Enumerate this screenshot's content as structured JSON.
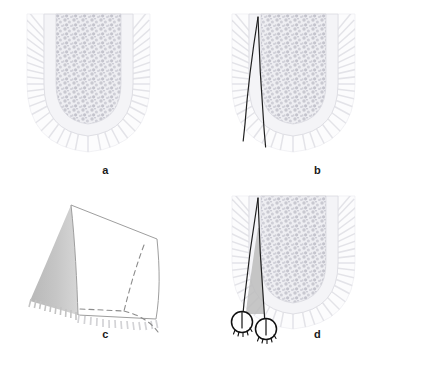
{
  "figure": {
    "background_color": "#ffffff",
    "width": 423,
    "height": 366,
    "panel_count": 4
  },
  "panels": [
    {
      "id": "a",
      "label": "a",
      "caption": "Cross-section of alveolar bone: cortical plate, trabecular bone and overlying soft tissue",
      "elements": [
        "soft-tissue-outline",
        "periosteum-hatching",
        "cortical-bone-layer",
        "trabecular-bone-texture"
      ]
    },
    {
      "id": "b",
      "label": "b",
      "caption": "Two vertical releasing incision lines converging at the crest",
      "elements": [
        "soft-tissue-outline",
        "periosteum-hatching",
        "cortical-bone-layer",
        "trabecular-bone-texture",
        "incision-line-anterior",
        "incision-line-posterior"
      ]
    },
    {
      "id": "c",
      "label": "c",
      "caption": "Three-dimensional view of the elevated pedicle flap wedge",
      "elements": [
        "flap-top-face",
        "flap-shaded-side-face",
        "flap-hidden-edges-dashed",
        "flap-serrated-base"
      ]
    },
    {
      "id": "d",
      "label": "d",
      "caption": "Repositioned flap secured with two interrupted sutures",
      "elements": [
        "soft-tissue-outline",
        "periosteum-hatching",
        "cortical-bone-layer",
        "trabecular-bone-texture",
        "incision-line-anterior",
        "incision-line-posterior",
        "flap-shaded-region",
        "suture-knot-left",
        "suture-knot-right"
      ]
    }
  ],
  "colors": {
    "background": "#ffffff",
    "soft_tissue_fill": "#fbfbfc",
    "soft_tissue_stroke": "#ececef",
    "periosteum_hatch": "#e6e6ea",
    "cortical_fill": "#f4f4f6",
    "cortical_stroke": "#d8d8de",
    "trabecular_fill": "#e9e9ee",
    "trabecular_speck": "#c6c6cd",
    "incision_line": "#1f1f1f",
    "flap_shade": "#bdbdbd",
    "flap_shade_light": "#c9c9c9",
    "flap_outline": "#9a9a9a",
    "dashed_line": "#8d8d8d",
    "suture_stroke": "#111111",
    "label_text": "#1a1a1a"
  },
  "labels": {
    "a": "a",
    "b": "b",
    "c": "c",
    "d": "d"
  }
}
